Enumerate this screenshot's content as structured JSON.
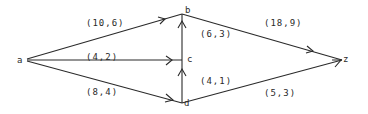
{
  "diagram": {
    "type": "flow-network",
    "nodes": [
      {
        "id": "a",
        "label": "a",
        "x": 22,
        "y": 60
      },
      {
        "id": "b",
        "label": "b",
        "x": 182,
        "y": 14
      },
      {
        "id": "c",
        "label": "c",
        "x": 182,
        "y": 60
      },
      {
        "id": "d",
        "label": "d",
        "x": 182,
        "y": 103
      },
      {
        "id": "z",
        "label": "z",
        "x": 344,
        "y": 60
      }
    ],
    "edges": [
      {
        "id": "a-b",
        "from": "a",
        "to": "b",
        "label": "(10,6)"
      },
      {
        "id": "a-c",
        "from": "a",
        "to": "c",
        "label": "(4,2)"
      },
      {
        "id": "a-d",
        "from": "a",
        "to": "d",
        "label": "(8,4)"
      },
      {
        "id": "c-b",
        "from": "c",
        "to": "b",
        "label": "(6,3)"
      },
      {
        "id": "d-c",
        "from": "d",
        "to": "c",
        "label": "(4,1)"
      },
      {
        "id": "b-z",
        "from": "b",
        "to": "z",
        "label": "(18,9)"
      },
      {
        "id": "d-z",
        "from": "d",
        "to": "z",
        "label": "(5,3)"
      }
    ]
  }
}
